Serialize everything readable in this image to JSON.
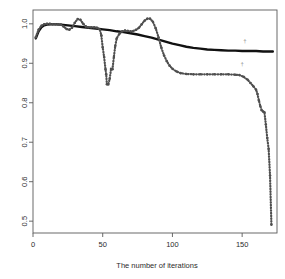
{
  "chart_data": {
    "type": "line",
    "title": "",
    "xlabel": "The number of iterations",
    "ylabel": "",
    "xlim": [
      0,
      175
    ],
    "ylim": [
      0.47,
      1.035
    ],
    "xticks": [
      0,
      50,
      100,
      150
    ],
    "xtick_labels": [
      "0",
      "50",
      "100",
      "150"
    ],
    "yticks": [
      0.5,
      0.6,
      0.7,
      0.8,
      0.9,
      1.0
    ],
    "ytick_labels": [
      "0.5",
      "0.6",
      "0.7",
      "0.8",
      "0.9",
      "1.0"
    ],
    "grid": false,
    "legend": "none",
    "box": true,
    "series": [
      {
        "name": "smooth-black-curve",
        "style": "solid",
        "color": "#111111",
        "width": 2.4,
        "x": [
          2,
          4,
          6,
          8,
          10,
          13,
          16,
          20,
          25,
          30,
          35,
          40,
          45,
          50,
          55,
          60,
          65,
          70,
          75,
          80,
          85,
          90,
          95,
          100,
          105,
          110,
          115,
          120,
          125,
          130,
          135,
          140,
          145,
          150,
          155,
          160,
          165,
          170,
          172
        ],
        "y": [
          0.963,
          0.981,
          0.991,
          0.996,
          0.998,
          0.999,
          0.999,
          0.998,
          0.996,
          0.994,
          0.992,
          0.99,
          0.988,
          0.986,
          0.984,
          0.981,
          0.979,
          0.976,
          0.973,
          0.969,
          0.965,
          0.96,
          0.955,
          0.95,
          0.946,
          0.942,
          0.939,
          0.937,
          0.935,
          0.934,
          0.933,
          0.932,
          0.932,
          0.931,
          0.931,
          0.931,
          0.93,
          0.93,
          0.93
        ]
      },
      {
        "name": "dotted-gray-curve",
        "style": "dotted",
        "color": "#4f4f4f",
        "width": 2.2,
        "x": [
          2,
          4,
          6,
          8,
          10,
          12,
          14,
          16,
          18,
          20,
          22,
          24,
          26,
          28,
          30,
          32,
          34,
          36,
          38,
          40,
          42,
          44,
          46,
          48,
          49,
          50,
          51,
          52,
          52.5,
          53,
          54,
          55,
          56,
          57,
          58,
          59,
          60,
          62,
          64,
          66,
          68,
          70,
          72,
          74,
          76,
          78,
          80,
          82,
          84,
          86,
          88,
          90,
          92,
          94,
          96,
          98,
          100,
          103,
          106,
          110,
          115,
          120,
          125,
          130,
          135,
          140,
          145,
          148,
          151,
          154,
          156,
          158,
          160,
          161,
          162,
          163,
          164,
          165,
          166,
          167,
          168,
          169,
          170,
          171
        ],
        "y": [
          0.966,
          0.985,
          0.995,
          0.999,
          1.0,
          1.0,
          0.999,
          0.999,
          0.999,
          0.998,
          0.993,
          0.987,
          0.985,
          0.99,
          1.003,
          1.012,
          1.01,
          1.0,
          0.993,
          0.991,
          0.991,
          0.991,
          0.99,
          0.985,
          0.971,
          0.94,
          0.916,
          0.885,
          0.872,
          0.847,
          0.846,
          0.861,
          0.886,
          0.885,
          0.916,
          0.944,
          0.963,
          0.975,
          0.981,
          0.983,
          0.982,
          0.981,
          0.982,
          0.985,
          0.99,
          0.999,
          1.008,
          1.013,
          1.013,
          1.005,
          0.989,
          0.966,
          0.94,
          0.92,
          0.905,
          0.894,
          0.886,
          0.879,
          0.875,
          0.873,
          0.872,
          0.872,
          0.872,
          0.872,
          0.872,
          0.872,
          0.871,
          0.87,
          0.866,
          0.858,
          0.85,
          0.842,
          0.833,
          0.822,
          0.806,
          0.792,
          0.781,
          0.778,
          0.776,
          0.745,
          0.711,
          0.683,
          0.616,
          0.491
        ]
      }
    ],
    "annotations": [
      {
        "name": "upper-tick-mark",
        "x": 152,
        "y": 0.951,
        "glyph": "†"
      },
      {
        "name": "lower-tick-mark",
        "x": 150,
        "y": 0.892,
        "glyph": "†"
      }
    ]
  },
  "axis": {
    "x_title": "The number of iterations"
  }
}
